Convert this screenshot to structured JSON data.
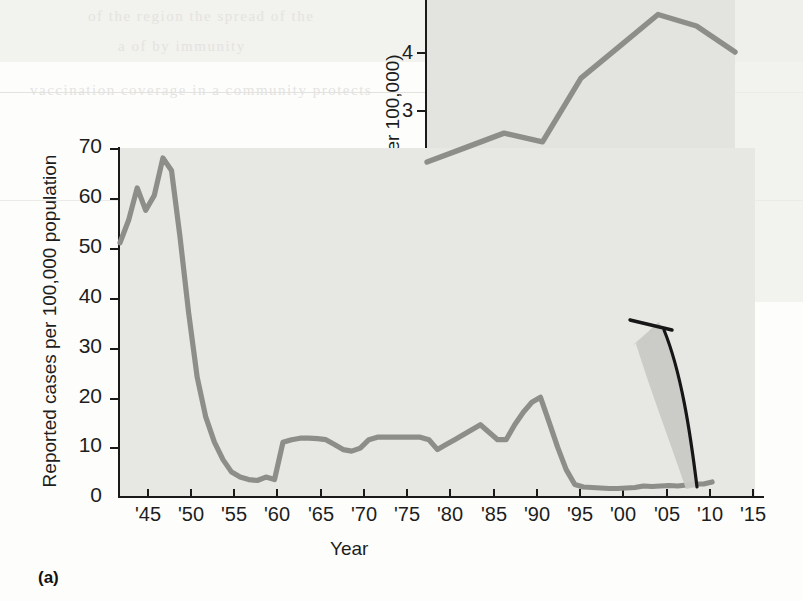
{
  "figure": {
    "panel_label": "(a)",
    "background_color": "#e7e7e4",
    "line_color": "#8d8d8a",
    "axis_color": "#1a1a1a"
  },
  "ghost_page_text": [
    {
      "text": "of the    region    the    spread    of the",
      "x": 88,
      "y": 8
    },
    {
      "text": "a        of        by        immunity",
      "x": 118,
      "y": 38
    },
    {
      "text": "vaccination coverage in a community protects",
      "x": 30,
      "y": 82
    },
    {
      "text": "MMR",
      "x": 560,
      "y": 128
    },
    {
      "text": "and continued the",
      "x": 122,
      "y": 178
    },
    {
      "text": "measles    genotype",
      "x": 148,
      "y": 208
    },
    {
      "text": "and     measles",
      "x": 490,
      "y": 214
    },
    {
      "text": "and  MMR",
      "x": 520,
      "y": 246
    },
    {
      "text": "in  reducing  the",
      "x": 470,
      "y": 276
    },
    {
      "text": "Ongoing  at  reduce  risk  of  measles",
      "x": 440,
      "y": 308
    },
    {
      "text": "by     the      continuing     are",
      "x": 462,
      "y": 338
    },
    {
      "text": "exact",
      "x": 540,
      "y": 368
    },
    {
      "text": "National  Institute  for",
      "x": 470,
      "y": 400
    },
    {
      "text": "Measles   Weekly   Report",
      "x": 452,
      "y": 432
    }
  ],
  "main_axes": {
    "y_title": "Reported cases per 100,000 population",
    "x_title": "Year",
    "y_ticks": [
      0,
      10,
      20,
      30,
      40,
      50,
      60,
      70
    ],
    "x_ticks": [
      "'45",
      "'50",
      "'55",
      "'60",
      "'65",
      "'70",
      "'75",
      "'80",
      "'85",
      "'90",
      "'95",
      "'00",
      "'05",
      "'10",
      "'15"
    ]
  },
  "inset_axes": {
    "y_title": "Cases (per 100,000)",
    "y_ticks": [
      1,
      2,
      3,
      4
    ],
    "x_ticks": [
      "'03",
      "'04",
      "'05",
      "'06",
      "'07",
      "'08",
      "'09",
      "'10",
      "'11"
    ]
  },
  "annotation": {
    "name": "curved-arrow",
    "description": "gray curved arrow pointing from end of main series up to the inset chart"
  },
  "chart_data": [
    {
      "type": "line",
      "id": "main",
      "title": "",
      "xlabel": "Year",
      "ylabel": "Reported cases per 100,000 population",
      "xlim": [
        1942,
        2016
      ],
      "ylim": [
        0,
        70
      ],
      "grid": false,
      "legend": "none",
      "x": [
        1942,
        1943,
        1944,
        1945,
        1946,
        1947,
        1948,
        1949,
        1950,
        1951,
        1952,
        1953,
        1954,
        1955,
        1956,
        1957,
        1958,
        1959,
        1960,
        1961,
        1962,
        1963,
        1964,
        1965,
        1966,
        1967,
        1968,
        1969,
        1970,
        1971,
        1972,
        1973,
        1974,
        1975,
        1976,
        1977,
        1978,
        1979,
        1980,
        1981,
        1982,
        1983,
        1984,
        1985,
        1986,
        1987,
        1988,
        1989,
        1990,
        1991,
        1992,
        1993,
        1994,
        1995,
        1996,
        1997,
        1998,
        1999,
        2000,
        2001,
        2002,
        2003,
        2004,
        2005,
        2006,
        2007,
        2008,
        2009,
        2010,
        2011
      ],
      "values": [
        51,
        55.5,
        62,
        57.5,
        60.5,
        68,
        65.5,
        52,
        37,
        24,
        16,
        11,
        7.5,
        5,
        4,
        3.5,
        3.3,
        4,
        3.5,
        11,
        11.5,
        11.8,
        11.8,
        11.7,
        11.5,
        10.5,
        9.5,
        9.2,
        9.8,
        11.5,
        12,
        12,
        12,
        12,
        12,
        12,
        11.5,
        9.5,
        10.5,
        11.5,
        12.5,
        13.5,
        14.5,
        13,
        11.5,
        11.5,
        14.5,
        17,
        19,
        20,
        15,
        10,
        5.5,
        2.5,
        2,
        1.9,
        1.8,
        1.7,
        1.7,
        1.8,
        1.9,
        2.2,
        2.1,
        2.2,
        2.3,
        2.2,
        2.4,
        2.6,
        2.6,
        3
      ]
    },
    {
      "type": "line",
      "id": "inset",
      "title": "",
      "xlabel": "",
      "ylabel": "Cases (per 100,000)",
      "categories": [
        "'03",
        "'04",
        "'05",
        "'06",
        "'07",
        "'08",
        "'09",
        "'10",
        "'11"
      ],
      "x": [
        2003,
        2004,
        2005,
        2006,
        2007,
        2008,
        2009,
        2010,
        2011
      ],
      "values": [
        2.2,
        2.45,
        2.7,
        2.55,
        3.65,
        4.2,
        4.75,
        4.55,
        4.1
      ],
      "xlim": [
        2003,
        2011
      ],
      "ylim": [
        0.3,
        5.0
      ],
      "grid": false,
      "legend": "none"
    }
  ]
}
